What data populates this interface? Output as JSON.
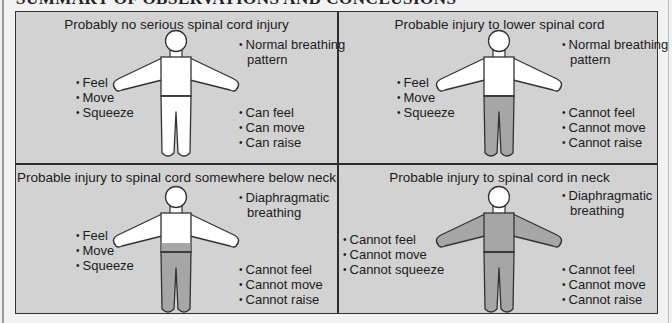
{
  "page": {
    "title": "SUMMARY OF OBSERVATIONS AND CONCLUSIONS"
  },
  "colors": {
    "panel_background": "#d2d2d2",
    "unaffected_fill": "#ffffff",
    "affected_fill": "#a6a6a6",
    "outline": "#333333"
  },
  "panels": [
    {
      "title": "Probably no serious spinal cord injury",
      "breathing": [
        "Normal breathing",
        "pattern"
      ],
      "upper_limbs": [
        "Feel",
        "Move",
        "Squeeze"
      ],
      "lower_limbs": [
        "Can feel",
        "Can move",
        "Can raise"
      ],
      "affected_region": "none"
    },
    {
      "title": "Probable injury to lower spinal cord",
      "breathing": [
        "Normal breathing",
        "pattern"
      ],
      "upper_limbs": [
        "Feel",
        "Move",
        "Squeeze"
      ],
      "lower_limbs": [
        "Cannot feel",
        "Cannot move",
        "Cannot raise"
      ],
      "affected_region": "legs"
    },
    {
      "title": "Probable injury to spinal cord somewhere below neck",
      "breathing": [
        "Diaphragmatic",
        "breathing"
      ],
      "upper_limbs": [
        "Feel",
        "Move",
        "Squeeze"
      ],
      "lower_limbs": [
        "Cannot feel",
        "Cannot move",
        "Cannot raise"
      ],
      "affected_region": "below-chest"
    },
    {
      "title": "Probable injury to spinal cord in neck",
      "breathing": [
        "Diaphragmatic",
        "breathing"
      ],
      "upper_limbs": [
        "Cannot feel",
        "Cannot move",
        "Cannot squeeze"
      ],
      "lower_limbs": [
        "Cannot feel",
        "Cannot move",
        "Cannot raise"
      ],
      "affected_region": "below-neck"
    }
  ]
}
